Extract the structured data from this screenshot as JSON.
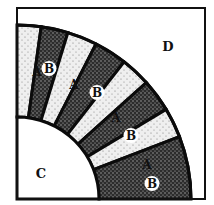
{
  "diagram": {
    "title": "",
    "frame": {
      "x": 17,
      "y": 8,
      "width": 188,
      "height": 191
    },
    "center": {
      "x": 17,
      "y": 199
    },
    "inner_radius": 82,
    "outer_radius": 174,
    "colors": {
      "light_fill": "#e9e9e9",
      "dark_fill": "#3a3a3a",
      "stroke": "#0b0b0b",
      "background": "#ffffff"
    },
    "regions": {
      "C": {
        "label": "C",
        "x": 41,
        "y": 178
      },
      "D": {
        "label": "D",
        "x": 168,
        "y": 51
      }
    },
    "wedges": [
      {
        "label": "A",
        "type": "light",
        "from_deg": 90,
        "to_deg": 82,
        "lx": 37,
        "ly": 76,
        "circled": false
      },
      {
        "label": "B",
        "type": "dark",
        "from_deg": 82,
        "to_deg": 73,
        "lx": 49,
        "ly": 73,
        "circled": true
      },
      {
        "label": "A",
        "type": "light",
        "from_deg": 73,
        "to_deg": 63,
        "lx": 74,
        "ly": 89,
        "circled": false
      },
      {
        "label": "B",
        "type": "dark",
        "from_deg": 63,
        "to_deg": 52,
        "lx": 97,
        "ly": 97,
        "circled": true
      },
      {
        "label": "A",
        "type": "light",
        "from_deg": 52,
        "to_deg": 42,
        "lx": 116,
        "ly": 122,
        "circled": false
      },
      {
        "label": "B",
        "type": "dark",
        "from_deg": 42,
        "to_deg": 31,
        "lx": 131,
        "ly": 140,
        "circled": true
      },
      {
        "label": "A",
        "type": "light",
        "from_deg": 31,
        "to_deg": 21,
        "lx": 147,
        "ly": 169,
        "circled": false
      },
      {
        "label": "B",
        "type": "dark",
        "from_deg": 21,
        "to_deg": 0,
        "lx": 152,
        "ly": 188,
        "circled": true
      }
    ]
  }
}
